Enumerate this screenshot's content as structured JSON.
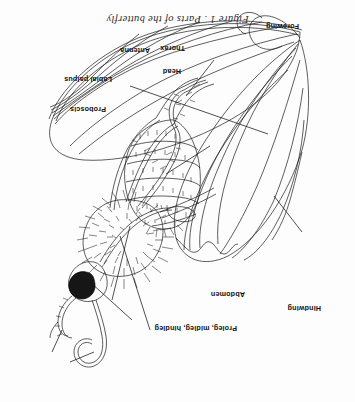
{
  "figure": {
    "caption": "Figure 1 . Parts of the butterfly",
    "orientation_degrees": 180,
    "background_color": "#fdfdfd",
    "ink_color": "#1a1a1a"
  },
  "labels": [
    {
      "id": "proleg-midleg-hindleg",
      "text": "Proleg, midleg, hindleg",
      "x": 118,
      "y": 70
    },
    {
      "id": "hindwing",
      "text": "Hindwing",
      "x": 34,
      "y": 90
    },
    {
      "id": "abdomen",
      "text": "Abdomen",
      "x": 110,
      "y": 104
    },
    {
      "id": "proboscis",
      "text": "Proboscis",
      "x": 249,
      "y": 289
    },
    {
      "id": "labial-palpus",
      "text": "Labial palpus",
      "x": 243,
      "y": 319
    },
    {
      "id": "antenna",
      "text": "Antenna",
      "x": 205,
      "y": 348
    },
    {
      "id": "head",
      "text": "Head",
      "x": 174,
      "y": 327
    },
    {
      "id": "thorax",
      "text": "Thorax",
      "x": 170,
      "y": 350
    },
    {
      "id": "forewing",
      "text": "Forewing",
      "x": 56,
      "y": 372
    }
  ]
}
